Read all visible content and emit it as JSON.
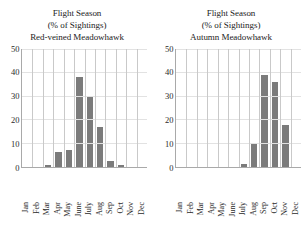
{
  "figure": {
    "panels": [
      {
        "name": "red-veined-meadowhawk",
        "title_line1": "Flight Season",
        "title_line2": "(% of Sightings)",
        "title_line3": "Red-veined Meadowhawk"
      },
      {
        "name": "autumn-meadowhawk",
        "title_line1": "Flight Season",
        "title_line2": "(% of Sightings)",
        "title_line3": "Autumn Meadowhawk"
      }
    ],
    "y_ticks": [
      "0",
      "10",
      "20",
      "30",
      "40",
      "50"
    ],
    "months": [
      "Jan",
      "Feb",
      "Mar",
      "Apr",
      "May",
      "June",
      "July",
      "Aug",
      "Sep",
      "Oct",
      "Nov",
      "Dec"
    ],
    "bar_color": "#7b7b7b",
    "gridline_color": "#e2e2e2",
    "separator_color": "#c9c9c9",
    "axis_color": "#a9a9a9"
  },
  "chart_data": [
    {
      "type": "bar",
      "title": "Flight Season (% of Sightings) Red-veined Meadowhawk",
      "xlabel": "",
      "ylabel": "",
      "categories": [
        "Jan",
        "Feb",
        "Mar",
        "Apr",
        "May",
        "June",
        "July",
        "Aug",
        "Sep",
        "Oct",
        "Nov",
        "Dec"
      ],
      "values": [
        0,
        0,
        0.5,
        6,
        7,
        38,
        30,
        17,
        2.5,
        0.5,
        0,
        0
      ],
      "ylim": [
        0,
        50
      ],
      "yticks": [
        0,
        10,
        20,
        30,
        40,
        50
      ],
      "grid": "horizontal",
      "legend": "none",
      "bar_color": "#7b7b7b"
    },
    {
      "type": "bar",
      "title": "Flight Season (% of Sightings) Autumn Meadowhawk",
      "xlabel": "",
      "ylabel": "",
      "categories": [
        "Jan",
        "Feb",
        "Mar",
        "Apr",
        "May",
        "June",
        "July",
        "Aug",
        "Sep",
        "Oct",
        "Nov",
        "Dec"
      ],
      "values": [
        0,
        0,
        0,
        0,
        0,
        0,
        1,
        9.5,
        39,
        36,
        17.5,
        0
      ],
      "ylim": [
        0,
        50
      ],
      "yticks": [
        0,
        10,
        20,
        30,
        40,
        50
      ],
      "grid": "horizontal",
      "legend": "none",
      "bar_color": "#7b7b7b"
    }
  ]
}
